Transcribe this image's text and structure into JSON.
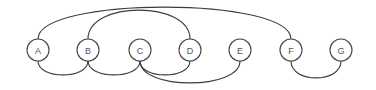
{
  "figure": {
    "width": 376,
    "height": 90,
    "background_color": "#ffffff",
    "baseline_y": 50,
    "node_radius": 11,
    "edge_color": "#3c3c3c",
    "node_stroke_color": "#4a4a4a",
    "node_fill_color": "#ffffff",
    "label_color": "#555555"
  },
  "chart_data": {
    "type": "diagram",
    "diagram_kind": "arc-diagram",
    "title": "",
    "nodes": [
      {
        "id": "A",
        "label": "A",
        "x": 38,
        "y": 50
      },
      {
        "id": "B",
        "label": "B",
        "x": 88,
        "y": 50
      },
      {
        "id": "C",
        "label": "C",
        "x": 140,
        "y": 50
      },
      {
        "id": "D",
        "label": "D",
        "x": 190,
        "y": 50
      },
      {
        "id": "E",
        "label": "E",
        "x": 240,
        "y": 50
      },
      {
        "id": "F",
        "label": "F",
        "x": 291,
        "y": 50
      },
      {
        "id": "G",
        "label": "G",
        "x": 341,
        "y": 50
      }
    ],
    "edges": [
      {
        "id": "edge-a-f",
        "source": "A",
        "target": "F",
        "side": "above",
        "apex_y": 10
      },
      {
        "id": "edge-b-d",
        "source": "B",
        "target": "D",
        "side": "above",
        "apex_y": 13
      },
      {
        "id": "edge-a-b",
        "source": "A",
        "target": "B",
        "side": "below",
        "apex_y": 72
      },
      {
        "id": "edge-b-c",
        "source": "B",
        "target": "C",
        "side": "below",
        "apex_y": 72
      },
      {
        "id": "edge-c-d",
        "source": "C",
        "target": "D",
        "side": "below",
        "apex_y": 72
      },
      {
        "id": "edge-c-e",
        "source": "C",
        "target": "E",
        "side": "below",
        "apex_y": 80
      },
      {
        "id": "edge-f-g",
        "source": "F",
        "target": "G",
        "side": "below",
        "apex_y": 75
      }
    ],
    "node_count": 7,
    "edge_count": 7
  }
}
